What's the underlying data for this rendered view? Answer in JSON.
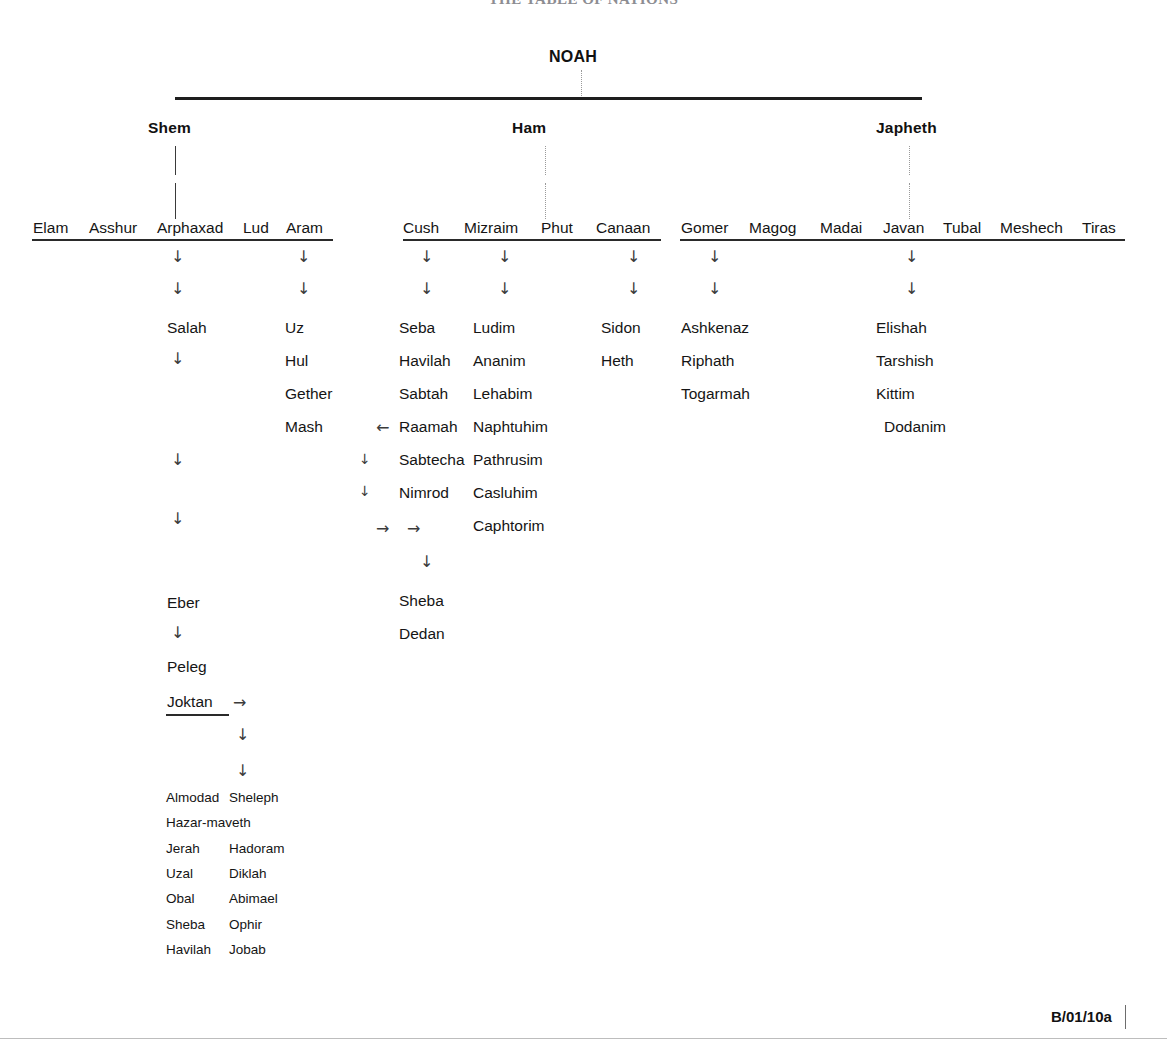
{
  "document": {
    "title": "THE  TABLE  OF  NATIONS",
    "footer_code": "B/01/10a"
  },
  "root": {
    "label": "NOAH"
  },
  "branches": [
    {
      "key": "shem",
      "label": "Shem"
    },
    {
      "key": "ham",
      "label": "Ham"
    },
    {
      "key": "japheth",
      "label": "Japheth"
    }
  ],
  "shem": {
    "sons": [
      "Elam",
      "Asshur",
      "Arphaxad",
      "Lud",
      "Aram"
    ],
    "arphaxad_line": {
      "names": [
        "Salah",
        "Eber",
        "Peleg",
        "Joktan"
      ],
      "joktan_arrow": "→"
    },
    "aram_line": [
      "Uz",
      "Hul",
      "Gether",
      "Mash"
    ],
    "joktan_sons_col1": [
      "Almodad",
      "Hazar-maveth",
      "Jerah",
      "Uzal",
      "Obal",
      "Sheba",
      "Havilah"
    ],
    "joktan_sons_col2": [
      "Sheleph",
      "",
      "Hadoram",
      "Diklah",
      "Abimael",
      "Ophir",
      "Jobab"
    ]
  },
  "ham": {
    "sons": [
      "Cush",
      "Mizraim",
      "Phut",
      "Canaan"
    ],
    "cush_line": [
      "Seba",
      "Havilah",
      "Sabtah",
      "Raamah",
      "Sabtecha",
      "Nimrod"
    ],
    "raamah_in_arrow": "←",
    "raamah_out_arrows": [
      "→",
      "→"
    ],
    "raamah_sons": [
      "Sheba",
      "Dedan"
    ],
    "mizraim_line": [
      "Ludim",
      "Ananim",
      "Lehabim",
      "Naphtuhim",
      "Pathrusim",
      "Casluhim",
      "Caphtorim"
    ],
    "canaan_line": [
      "Sidon",
      "Heth"
    ]
  },
  "japheth": {
    "sons": [
      "Gomer",
      "Magog",
      "Madai",
      "Javan",
      "Tubal",
      "Meshech",
      "Tiras"
    ],
    "gomer_line": [
      "Ashkenaz",
      "Riphath",
      "Togarmah"
    ],
    "javan_line": [
      "Elishah",
      "Tarshish",
      "Kittim",
      "Dodanim"
    ]
  },
  "glyphs": {
    "down": "↓",
    "right": "→",
    "left": "←"
  }
}
